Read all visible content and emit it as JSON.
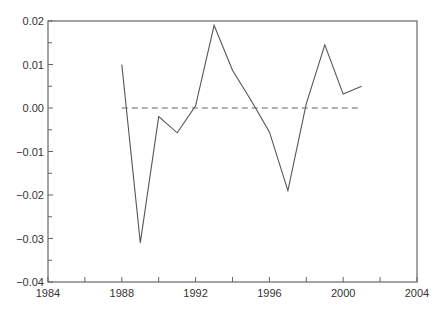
{
  "chart_data": {
    "type": "line",
    "title": "",
    "xlabel": "",
    "ylabel": "",
    "xlim": [
      1984,
      2004
    ],
    "ylim": [
      -0.04,
      0.02
    ],
    "grid": false,
    "legend": null,
    "x_ticks": [
      1984,
      1988,
      1992,
      1996,
      2000,
      2004
    ],
    "x_tick_labels": [
      "1984",
      "1988",
      "1992",
      "1996",
      "2000",
      "2004"
    ],
    "x_minor_ticks": [
      1986,
      1990,
      1994,
      1998,
      2002
    ],
    "y_ticks": [
      0.02,
      0.01,
      0.0,
      -0.01,
      -0.02,
      -0.03,
      -0.04
    ],
    "y_tick_labels": [
      "0.02",
      "0.01",
      "0.00",
      "−0.01",
      "−0.02",
      "−0.03",
      "−0.04"
    ],
    "x": [
      1988,
      1989,
      1990,
      1991,
      1992,
      1993,
      1994,
      1995,
      1996,
      1997,
      1998,
      1999,
      2000,
      2001
    ],
    "series": [
      {
        "name": "series",
        "style": "solid",
        "color": "#555555",
        "values": [
          0.01,
          -0.031,
          -0.002,
          -0.0057,
          0.0005,
          0.019,
          0.0087,
          0.0018,
          -0.0055,
          -0.019,
          0.001,
          0.0145,
          0.0032,
          0.005
        ]
      },
      {
        "name": "zero-reference",
        "style": "dashed",
        "color": "#666666",
        "x": [
          1988,
          2001
        ],
        "values": [
          0.0,
          0.0
        ]
      }
    ]
  }
}
